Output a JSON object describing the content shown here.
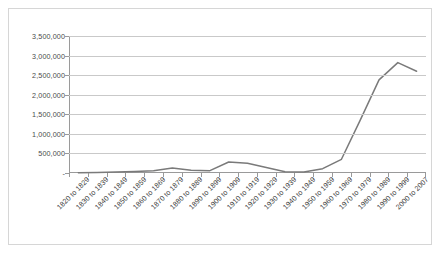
{
  "chart_data": {
    "type": "line",
    "title": "",
    "xlabel": "",
    "ylabel": "",
    "ylim": [
      0,
      3500000
    ],
    "ytick_values": [
      0,
      500000,
      1000000,
      1500000,
      2000000,
      2500000,
      3000000,
      3500000
    ],
    "ytick_labels": [
      "-",
      "500,000",
      "1,000,000",
      "1,500,000",
      "2,000,000",
      "2,500,000",
      "3,000,000",
      "3,500,000"
    ],
    "grid": true,
    "legend": false,
    "legend_position": "none",
    "line_color": "#7a7a7a",
    "categories": [
      "1820 to 1829",
      "1830 to 1839",
      "1840 to 1849",
      "1850 to 1859",
      "1860 to 1869",
      "1870 to 1879",
      "1880 to 1889",
      "1890 to 1899",
      "1900 to 1909",
      "1910 to 1919",
      "1920 to 1929",
      "1930 to 1939",
      "1940 to 1949",
      "1950 to 1959",
      "1960 to 1969",
      "1970 to 1979",
      "1980 to 1989",
      "1990 to 1999",
      "2000 to 2007"
    ],
    "values": [
      8000,
      15000,
      25000,
      40000,
      55000,
      130000,
      70000,
      60000,
      280000,
      250000,
      140000,
      30000,
      25000,
      110000,
      350000,
      1350000,
      2380000,
      2820000,
      2600000
    ]
  },
  "caption": {
    "text": ""
  }
}
